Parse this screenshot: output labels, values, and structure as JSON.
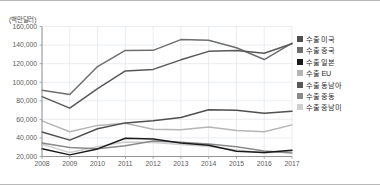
{
  "unit_label": "(백만달러)",
  "legend": {
    "position": "right",
    "items": [
      {
        "label": "수출 미국",
        "color": "#4f4f4f",
        "swatch_name": "legend-swatch-us"
      },
      {
        "label": "수출 중국",
        "color": "#6e6e6e",
        "swatch_name": "legend-swatch-china"
      },
      {
        "label": "수출 일본",
        "color": "#1a1a1a",
        "swatch_name": "legend-swatch-japan"
      },
      {
        "label": "수출 EU",
        "color": "#b5b5b5",
        "swatch_name": "legend-swatch-eu"
      },
      {
        "label": "수출 동남아",
        "color": "#585858",
        "swatch_name": "legend-swatch-sea"
      },
      {
        "label": "수출 중동",
        "color": "#8a8a8a",
        "swatch_name": "legend-swatch-mideast"
      },
      {
        "label": "수출 중남미",
        "color": "#cfcfcf",
        "swatch_name": "legend-swatch-latam"
      }
    ]
  },
  "chart_data": {
    "type": "line",
    "title": "",
    "xlabel": "",
    "ylabel": "(백만달러)",
    "grid": true,
    "legend_position": "right",
    "x": [
      2008,
      2009,
      2010,
      2011,
      2012,
      2013,
      2014,
      2015,
      2016,
      2017
    ],
    "categories": [
      "2008",
      "2009",
      "2010",
      "2011",
      "2012",
      "2013",
      "2014",
      "2015",
      "2016",
      "2017"
    ],
    "xlim": [
      2008,
      2017
    ],
    "ylim": [
      20000,
      160000
    ],
    "ytick_labels": [
      "160,000",
      "140,000",
      "120,000",
      "100,000",
      "80,000",
      "60,000",
      "40,000",
      "20,000"
    ],
    "ytick_values": [
      160000,
      140000,
      120000,
      100000,
      80000,
      60000,
      40000,
      20000
    ],
    "series": [
      {
        "name": "수출 미국",
        "color": "#4f4f4f",
        "values": [
          46377,
          37650,
          49816,
          56208,
          58525,
          62052,
          70285,
          69832,
          66462,
          68610
        ]
      },
      {
        "name": "수출 중국",
        "color": "#6e6e6e",
        "values": [
          91389,
          86703,
          116838,
          134185,
          134323,
          145869,
          145288,
          137124,
          124433,
          142120
        ]
      },
      {
        "name": "수출 일본",
        "color": "#1a1a1a",
        "values": [
          28252,
          21771,
          28176,
          39680,
          38796,
          34662,
          32184,
          25577,
          24355,
          26816
        ]
      },
      {
        "name": "수출 EU",
        "color": "#b5b5b5",
        "values": [
          58375,
          46608,
          53507,
          55727,
          49371,
          48857,
          51658,
          48078,
          46604,
          54038
        ]
      },
      {
        "name": "수출 동남아",
        "color": "#585858",
        "values": [
          84436,
          72077,
          93161,
          112089,
          113812,
          124096,
          133227,
          134060,
          131271,
          141510
        ]
      },
      {
        "name": "수출 중동",
        "color": "#8a8a8a",
        "values": [
          34598,
          29743,
          28375,
          31587,
          36772,
          35408,
          33570,
          30421,
          25930,
          23755
        ]
      },
      {
        "name": "수출 중남미",
        "color": "#cfcfcf",
        "values": [
          33200,
          24200,
          30600,
          35500,
          35100,
          33000,
          30800,
          27100,
          23900,
          25600
        ]
      }
    ]
  }
}
